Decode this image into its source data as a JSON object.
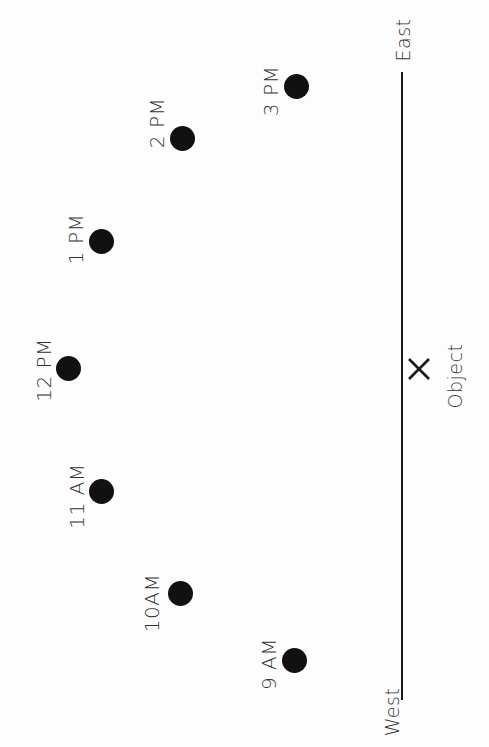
{
  "diagram": {
    "axis": {
      "east_label": "East",
      "west_label": "West"
    },
    "object": {
      "marker_icon": "x-mark-icon",
      "label": "Object"
    },
    "sun_positions": [
      {
        "time": "9 AM"
      },
      {
        "time": "10AM"
      },
      {
        "time": "11 AM"
      },
      {
        "time": "12 PM"
      },
      {
        "time": "1 PM"
      },
      {
        "time": "2 PM"
      },
      {
        "time": "3 PM"
      }
    ],
    "colors": {
      "background": "#fdfdfd",
      "dot": "#111111",
      "line": "#1a1a1a",
      "text": "#333333"
    }
  }
}
